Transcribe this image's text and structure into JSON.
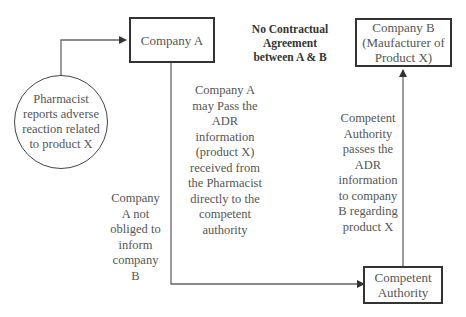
{
  "diagram": {
    "nodes": {
      "pharmacist": "Pharmacist\nreports adverse\nreaction related\nto product X",
      "company_a": "Company A",
      "company_b": "Company B\n(Maufacturer of\nProduct X)",
      "competent_authority": "Competent\nAuthority"
    },
    "annotations": {
      "no_contract": "No Contractual\nAgreement\nbetween A & B",
      "a_may_pass": "Company A\nmay Pass the\nADR\ninformation\n(product X)\nreceived from\nthe Pharmacist\ndirectly to the\ncompetent\nauthority",
      "a_not_obliged": "Company\nA not\nobliged to\ninform\ncompany\nB",
      "ca_passes": "Competent\nAuthority\npasses the\nADR\ninformation\nto company\nB regarding\nproduct X"
    },
    "edges": [
      {
        "from": "pharmacist",
        "to": "company_a"
      },
      {
        "from": "company_a",
        "to": "competent_authority"
      },
      {
        "from": "competent_authority",
        "to": "company_b"
      }
    ],
    "colors": {
      "line": "#555555",
      "border": "#333333",
      "text": "#555555"
    }
  }
}
